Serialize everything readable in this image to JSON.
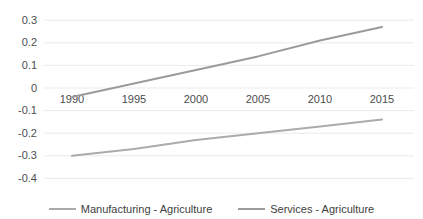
{
  "chart_data": {
    "type": "line",
    "title": "",
    "xlabel": "",
    "ylabel": "",
    "x": [
      1990,
      1995,
      2000,
      2005,
      2010,
      2015
    ],
    "x_tick_labels": [
      "1990",
      "1995",
      "2000",
      "2005",
      "2010",
      "2015"
    ],
    "y_tick_values": [
      0.3,
      0.2,
      0.1,
      0,
      -0.1,
      -0.2,
      -0.3,
      -0.4
    ],
    "y_tick_labels": [
      "0.3",
      "0.2",
      "0.1",
      "0",
      "-0.1",
      "-0.2",
      "-0.3",
      "-0.4"
    ],
    "ylim": [
      -0.4,
      0.3
    ],
    "grid": "horizontal-only",
    "legend_position": "bottom",
    "series": [
      {
        "name": "Manufacturing - Agriculture",
        "color": "#ababab",
        "values": [
          -0.3,
          -0.27,
          -0.23,
          -0.2,
          -0.17,
          -0.14
        ]
      },
      {
        "name": "Services - Agriculture",
        "color": "#9b9b9b",
        "values": [
          -0.04,
          0.02,
          0.08,
          0.14,
          0.21,
          0.27
        ]
      }
    ],
    "colors": {
      "background": "#ffffff",
      "gridline": "#ebebeb",
      "axis_text": "#4d4d4d"
    }
  }
}
